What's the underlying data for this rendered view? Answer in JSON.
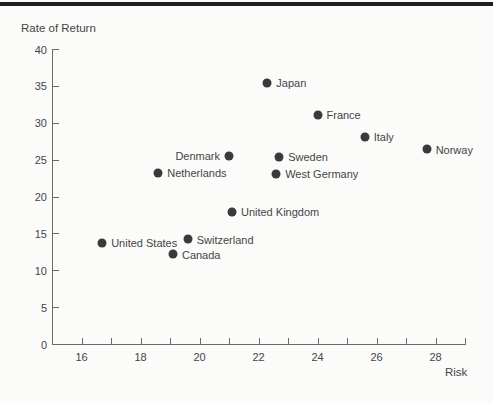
{
  "page": {
    "background": "#fbfbfa",
    "top_rule_color": "#1d1d1d"
  },
  "chart_data": {
    "type": "scatter",
    "title": "",
    "xlabel": "Risk",
    "ylabel": "Rate of Return",
    "grid": false,
    "legend": false,
    "x_axis": {
      "min": 15,
      "max": 29,
      "tick_step": 1,
      "labeled_ticks": [
        16,
        18,
        20,
        22,
        24,
        26,
        28
      ]
    },
    "y_axis": {
      "min": 0,
      "max": 40,
      "tick_step": 5,
      "ticks": [
        0,
        5,
        10,
        15,
        20,
        25,
        30,
        35,
        40
      ]
    },
    "points": [
      {
        "label": "Japan",
        "x": 22.3,
        "y": 35.4,
        "label_side": "right"
      },
      {
        "label": "France",
        "x": 24.0,
        "y": 31.1,
        "label_side": "right"
      },
      {
        "label": "Italy",
        "x": 25.6,
        "y": 28.1,
        "label_side": "right"
      },
      {
        "label": "Norway",
        "x": 27.7,
        "y": 26.4,
        "label_side": "right"
      },
      {
        "label": "Denmark",
        "x": 21.0,
        "y": 25.5,
        "label_side": "left"
      },
      {
        "label": "Sweden",
        "x": 22.7,
        "y": 25.4,
        "label_side": "right"
      },
      {
        "label": "Netherlands",
        "x": 18.6,
        "y": 23.2,
        "label_side": "right"
      },
      {
        "label": "West Germany",
        "x": 22.6,
        "y": 23.1,
        "label_side": "right"
      },
      {
        "label": "United Kingdom",
        "x": 21.1,
        "y": 17.9,
        "label_side": "right"
      },
      {
        "label": "Switzerland",
        "x": 19.6,
        "y": 14.2,
        "label_side": "right"
      },
      {
        "label": "United States",
        "x": 16.7,
        "y": 13.7,
        "label_side": "right"
      },
      {
        "label": "Canada",
        "x": 19.1,
        "y": 12.2,
        "label_side": "right"
      }
    ],
    "colors": {
      "point": "#3a3a3a",
      "axis": "#6a6a6a",
      "text": "#454545"
    }
  }
}
